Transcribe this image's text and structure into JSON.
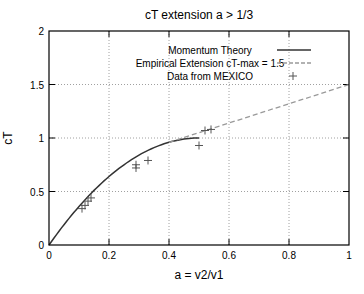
{
  "chart_data": {
    "type": "line",
    "title": "cT extension a > 1/3",
    "xlabel": "a = v2/v1",
    "ylabel": "cT",
    "xlim": [
      0,
      1
    ],
    "ylim": [
      0,
      2
    ],
    "xticks": [
      "0",
      "0.2",
      "0.4",
      "0.6",
      "0.8",
      "1"
    ],
    "yticks": [
      "0",
      "0.5",
      "1",
      "1.5",
      "2"
    ],
    "grid": true,
    "legend_position": "top-center inside",
    "series": [
      {
        "name": "Momentum Theory",
        "style": "solid",
        "color": "#333333",
        "formula": "4a(1-a)",
        "x": [
          0,
          0.05,
          0.1,
          0.15,
          0.2,
          0.25,
          0.3,
          0.35,
          0.4,
          0.45,
          0.5
        ],
        "y": [
          0,
          0.19,
          0.36,
          0.51,
          0.64,
          0.75,
          0.84,
          0.91,
          0.96,
          0.99,
          1.0
        ]
      },
      {
        "name": "Empirical Extension cT-max = 1.5",
        "style": "dashed",
        "color": "#999999",
        "x": [
          0.4,
          1.0
        ],
        "y": [
          0.96,
          1.5
        ]
      },
      {
        "name": "Data from MEXICO",
        "style": "markers",
        "marker": "+",
        "color": "#555555",
        "x": [
          0.11,
          0.12,
          0.13,
          0.14,
          0.29,
          0.29,
          0.33,
          0.5,
          0.52,
          0.54
        ],
        "y": [
          0.34,
          0.37,
          0.41,
          0.44,
          0.72,
          0.75,
          0.79,
          0.93,
          1.07,
          1.08
        ]
      }
    ]
  }
}
